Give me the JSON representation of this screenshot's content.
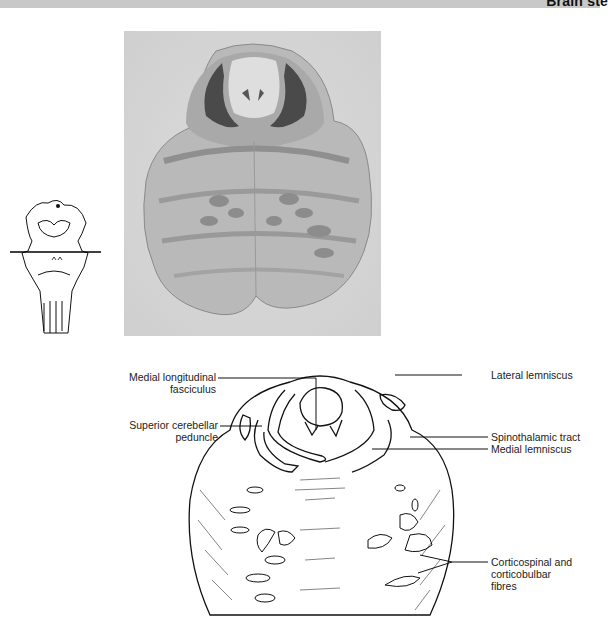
{
  "header": {
    "title": "Brain ste"
  },
  "photo": {
    "description": "Stained transverse section of pons (upper pons level)",
    "background": "#d9d9d9"
  },
  "orientation_diagram": {
    "description": "Brain stem outline with horizontal section line through upper pons"
  },
  "labels": {
    "mlf_line1": "Medial longitudinal",
    "mlf_line2": "fasciculus",
    "scp_line1": "Superior cerebellar",
    "scp_line2": "peduncle",
    "lateral_lemniscus": "Lateral lemniscus",
    "spinothalamic": "Spinothalamic tract",
    "medial_lemniscus": "Medial lemniscus",
    "cs_line1": "Corticospinal and",
    "cs_line2": "corticobulbar",
    "cs_line3": "fibres"
  }
}
